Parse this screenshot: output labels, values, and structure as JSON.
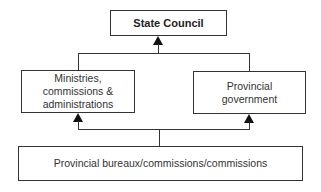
{
  "diagram": {
    "type": "org-chart",
    "nodes": {
      "top": {
        "label": "State Council"
      },
      "left": {
        "label": "Ministries,\ncommissions &\nadministrations"
      },
      "right": {
        "label": "Provincial\ngovernment"
      },
      "bottom": {
        "label": "Provincial bureaux/commissions/commissions"
      }
    },
    "edges": [
      {
        "from": "left",
        "to": "top"
      },
      {
        "from": "right",
        "to": "top"
      },
      {
        "from": "bottom",
        "to": "left"
      },
      {
        "from": "bottom",
        "to": "right"
      }
    ],
    "colors": {
      "line": "#333333",
      "arrow": "#111111",
      "background": "#ffffff"
    }
  }
}
